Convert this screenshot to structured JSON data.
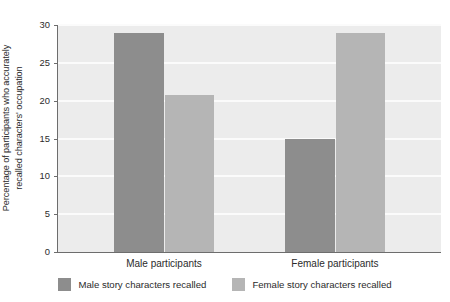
{
  "chart_data": {
    "type": "bar",
    "title": "",
    "xlabel": "",
    "ylabel_line1": "Percentage of participants who accurately",
    "ylabel_line2": "recalled characters' occupation",
    "categories": [
      "Male participants",
      "Female participants"
    ],
    "series": [
      {
        "name": "Male story characters recalled",
        "color": "#8d8d8d",
        "values": [
          29,
          15
        ]
      },
      {
        "name": "Female story characters recalled",
        "color": "#b5b5b5",
        "values": [
          20.8,
          29
        ]
      }
    ],
    "ylim": [
      0,
      30
    ],
    "yticks": [
      0,
      5,
      10,
      15,
      20,
      25,
      30
    ],
    "ytick_labels": [
      "0",
      "5",
      "10",
      "15",
      "20",
      "25",
      "30"
    ],
    "grid": true,
    "grid_color": "#fbfbfb",
    "plot_background": "#ececec",
    "legend_position": "bottom"
  }
}
